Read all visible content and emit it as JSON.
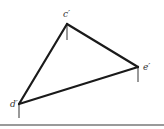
{
  "diagram": {
    "type": "triangle-projection",
    "vertices": [
      {
        "id": "c",
        "label": "c′",
        "x": 67,
        "y": 24,
        "label_x": 63,
        "label_y": 17,
        "tick_end_y": 40
      },
      {
        "id": "e",
        "label": "e′",
        "x": 138,
        "y": 67,
        "label_x": 143,
        "label_y": 70,
        "tick_end_y": 82
      },
      {
        "id": "d",
        "label": "d′",
        "x": 19,
        "y": 104,
        "label_x": 10,
        "label_y": 107,
        "tick_end_y": 118
      }
    ],
    "edges": [
      [
        "c",
        "e"
      ],
      [
        "e",
        "d"
      ],
      [
        "d",
        "c"
      ]
    ],
    "baseline": {
      "y": 125,
      "color": "#9a9a9a"
    },
    "colors": {
      "edge": "#1a1a1a",
      "tick": "#555555",
      "label": "#333333"
    }
  }
}
